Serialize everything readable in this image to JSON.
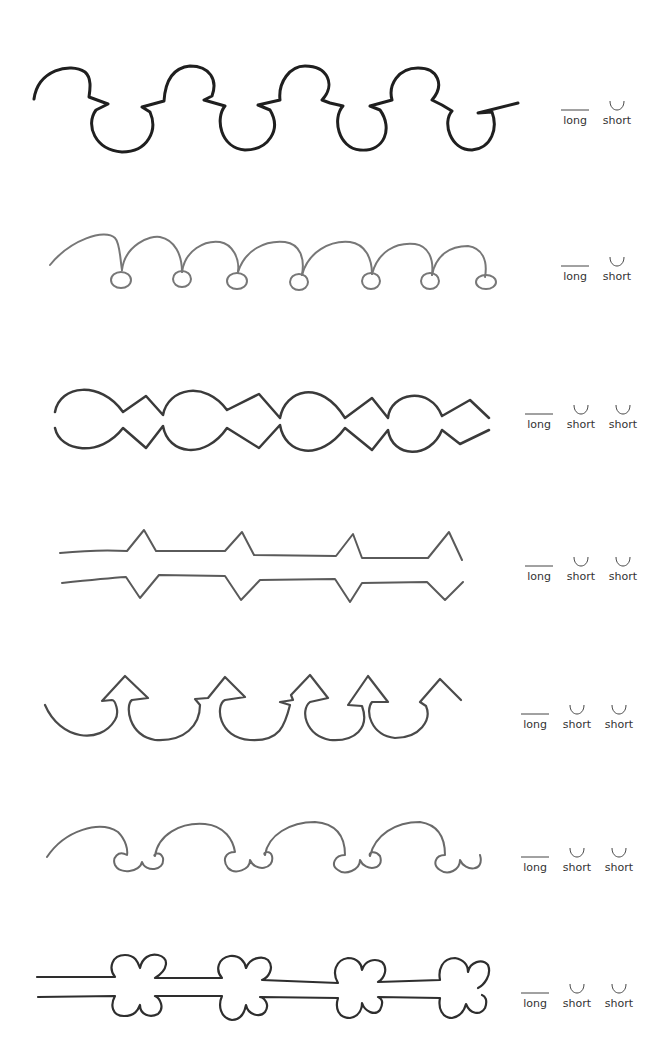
{
  "rows": [
    {
      "id": "row-1",
      "legend": [
        {
          "type": "long",
          "label": "long"
        },
        {
          "type": "short",
          "label": "short"
        }
      ]
    },
    {
      "id": "row-2",
      "legend": [
        {
          "type": "long",
          "label": "long"
        },
        {
          "type": "short",
          "label": "short"
        }
      ]
    },
    {
      "id": "row-3",
      "legend": [
        {
          "type": "long",
          "label": "long"
        },
        {
          "type": "short",
          "label": "short"
        },
        {
          "type": "short",
          "label": "short"
        }
      ]
    },
    {
      "id": "row-4",
      "legend": [
        {
          "type": "long",
          "label": "long"
        },
        {
          "type": "short",
          "label": "short"
        },
        {
          "type": "short",
          "label": "short"
        }
      ]
    },
    {
      "id": "row-5",
      "legend": [
        {
          "type": "long",
          "label": "long"
        },
        {
          "type": "short",
          "label": "short"
        },
        {
          "type": "short",
          "label": "short"
        }
      ]
    },
    {
      "id": "row-6",
      "legend": [
        {
          "type": "long",
          "label": "long"
        },
        {
          "type": "short",
          "label": "short"
        },
        {
          "type": "short",
          "label": "short"
        }
      ]
    },
    {
      "id": "row-7",
      "legend": [
        {
          "type": "long",
          "label": "long"
        },
        {
          "type": "short",
          "label": "short"
        },
        {
          "type": "short",
          "label": "short"
        }
      ]
    }
  ],
  "colors": {
    "stroke_dark": "#1e1e1e",
    "stroke_gray": "#555555",
    "stroke_light": "#8a8a8a"
  }
}
